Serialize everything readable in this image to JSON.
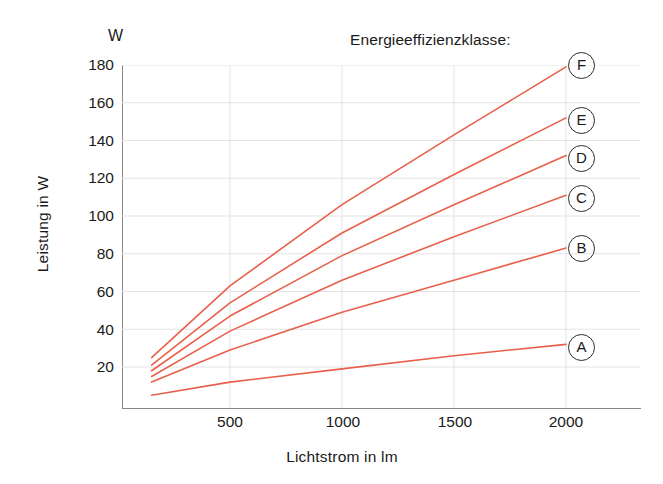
{
  "chart_data": {
    "type": "line",
    "title": "Energieeffizienzklasse:",
    "xlabel": "Lichtstrom in lm",
    "ylabel": "Leistung in W",
    "yunit": "W",
    "xlim": [
      100,
      2200
    ],
    "ylim": [
      0,
      190
    ],
    "xticks": [
      500,
      1000,
      1500,
      2000
    ],
    "yticks": [
      20,
      40,
      60,
      80,
      100,
      120,
      140,
      160,
      180
    ],
    "grid": true,
    "legend_position": "right-endpoints",
    "line_color": "#e8604c",
    "x": [
      150,
      500,
      1000,
      1500,
      2000
    ],
    "series": [
      {
        "name": "F",
        "label": "F",
        "values": [
          25,
          63,
          106,
          143,
          179
        ]
      },
      {
        "name": "E",
        "label": "E",
        "values": [
          21,
          54,
          91,
          122,
          152
        ]
      },
      {
        "name": "D",
        "label": "D",
        "values": [
          18,
          47,
          79,
          106,
          132
        ]
      },
      {
        "name": "C",
        "label": "C",
        "values": [
          15,
          39,
          66,
          89,
          111
        ]
      },
      {
        "name": "B",
        "label": "B",
        "values": [
          12,
          29,
          49,
          66,
          83
        ]
      },
      {
        "name": "A",
        "label": "A",
        "values": [
          5,
          12,
          19,
          26,
          32
        ]
      }
    ]
  },
  "axis": {
    "ytick_labels": [
      "180",
      "160",
      "140",
      "120",
      "100",
      "80",
      "60",
      "40",
      "20"
    ],
    "xtick_labels": [
      "500",
      "1000",
      "1500",
      "2000"
    ]
  },
  "legend": {
    "badges": [
      "F",
      "E",
      "D",
      "C",
      "B",
      "A"
    ]
  }
}
